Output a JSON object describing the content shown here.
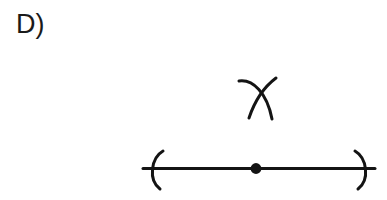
{
  "canvas": {
    "width": 387,
    "height": 200,
    "background_color": "#ffffff",
    "ink_color": "#141414"
  },
  "label": {
    "text": "D)",
    "name": "option-label-d",
    "x": 16,
    "y": 11,
    "font_size": 27
  },
  "diagram": {
    "type": "geometric-construction",
    "number_line": {
      "name": "horizontal-line",
      "x_start": 143,
      "x_end": 375,
      "y": 168,
      "stroke_width": 3
    },
    "left_endpoint": {
      "name": "left-parenthesis-arc",
      "symbol": "(",
      "center_x": 157,
      "top_y": 151,
      "bottom_y": 189,
      "stroke_width": 3
    },
    "right_endpoint": {
      "name": "right-parenthesis-arc",
      "symbol": ")",
      "center_x": 359,
      "top_y": 151,
      "bottom_y": 189,
      "stroke_width": 3
    },
    "midpoint_dot": {
      "name": "midpoint-dot",
      "cx": 256,
      "cy": 168,
      "radius": 5.4
    },
    "construction_arcs": [
      {
        "name": "construction-arc-left",
        "start_x": 239,
        "start_y": 81,
        "end_x": 272,
        "end_y": 119,
        "stroke_width": 3
      },
      {
        "name": "construction-arc-right",
        "start_x": 276,
        "start_y": 78,
        "end_x": 249,
        "end_y": 118,
        "stroke_width": 3
      }
    ],
    "arc_intersection": {
      "name": "arc-intersection-point",
      "x": 259,
      "y": 89
    }
  }
}
